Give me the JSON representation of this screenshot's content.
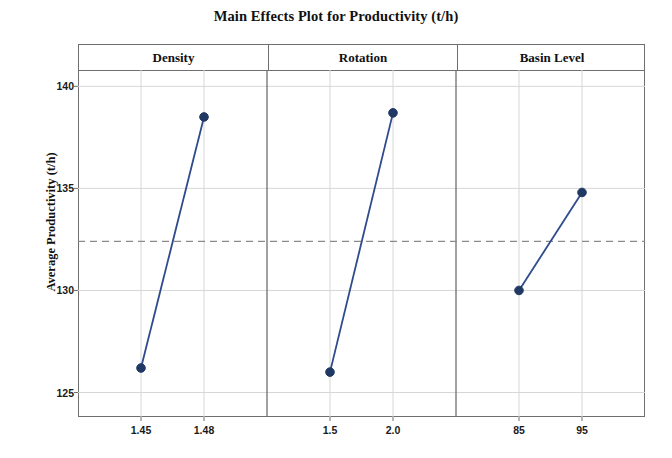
{
  "chart_data": {
    "type": "line",
    "title": "Main Effects Plot for Productivity (t/h)",
    "xlabel": "",
    "ylabel": "Average Productivity (t/h)",
    "ylim": [
      123.8,
      140.8
    ],
    "yticks": [
      125,
      130,
      135,
      140
    ],
    "ytick_labels": [
      "125",
      "130",
      "135",
      "140"
    ],
    "grid": true,
    "legend": "none",
    "reference_line": {
      "value": 132.4,
      "style": "dashed",
      "label": "overall mean"
    },
    "marker": {
      "shape": "circle",
      "color": "#1F3864",
      "size": 7
    },
    "line": {
      "color": "#2E4B8C",
      "width": 1.8
    },
    "panels": [
      {
        "name": "Density",
        "categories": [
          "1.45",
          "1.48"
        ],
        "values": [
          126.2,
          138.5
        ]
      },
      {
        "name": "Rotation",
        "categories": [
          "1.5",
          "2.0"
        ],
        "values": [
          126.0,
          138.7
        ]
      },
      {
        "name": "Basin Level",
        "categories": [
          "85",
          "95"
        ],
        "values": [
          130.0,
          134.8
        ]
      }
    ]
  },
  "colors": {
    "marker": "#1F3864",
    "line": "#2E4B8C",
    "frame": "#6f6f6f",
    "grid": "#d6d6d6",
    "reference": "#8a8a8a",
    "text": "#111111"
  }
}
